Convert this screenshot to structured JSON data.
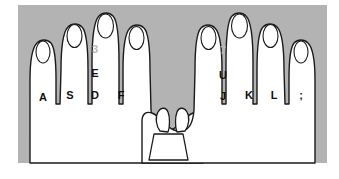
{
  "diagram": {
    "type": "hands-on-keyboard-illustration",
    "colors": {
      "background": "#ffffff",
      "keyboard_panel": "#b3b3b3",
      "hand_fill": "#ffffff",
      "hand_outline": "#1a1a1a",
      "nail_fill": "#ffffff",
      "nail_outline": "#1a1a1a",
      "label_text": "#0f0f0f",
      "number_text": "#b9b9b9",
      "spacebar_fill": "#ffffff"
    },
    "panel": {
      "x": 18,
      "y": 5,
      "width": 309,
      "height": 158
    }
  },
  "left_hand": {
    "name": "left-hand",
    "fingers": [
      {
        "id": "left-pinky",
        "label": "A",
        "label_x": 43,
        "label_y": 98
      },
      {
        "id": "left-ring",
        "label": "S",
        "label_x": 70,
        "label_y": 96
      },
      {
        "id": "left-middle",
        "label": "D",
        "label_x": 95,
        "label_y": 96
      },
      {
        "id": "left-index",
        "label": "F",
        "label_x": 121,
        "label_y": 96
      }
    ],
    "reach_keys": [
      {
        "id": "left-middle-reach-letter",
        "label": "E",
        "label_x": 95,
        "label_y": 74
      },
      {
        "id": "left-middle-reach-number",
        "label": "3",
        "label_x": 95,
        "label_y": 50
      }
    ]
  },
  "right_hand": {
    "name": "right-hand",
    "fingers": [
      {
        "id": "right-index",
        "label": "J",
        "label_x": 223,
        "label_y": 97
      },
      {
        "id": "right-middle",
        "label": "K",
        "label_x": 249,
        "label_y": 96
      },
      {
        "id": "right-ring",
        "label": "L",
        "label_x": 274,
        "label_y": 96
      },
      {
        "id": "right-pinky",
        "label": ";",
        "label_x": 301,
        "label_y": 96
      }
    ],
    "reach_keys": [
      {
        "id": "right-index-reach-letter",
        "label": "U",
        "label_x": 223,
        "label_y": 76
      },
      {
        "id": "right-index-reach-number",
        "label": "7",
        "label_x": 223,
        "label_y": 51
      }
    ]
  },
  "thumbs": {
    "name": "thumbs-over-spacebar",
    "left_thumb": "left-thumb",
    "right_thumb": "right-thumb",
    "spacebar": "space-bar"
  }
}
